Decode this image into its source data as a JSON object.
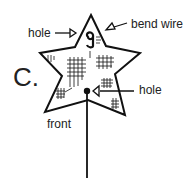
{
  "diagram": {
    "step_label": "C.",
    "labels": {
      "hole_top": "hole",
      "bend_wire": "bend wire",
      "hole_center": "hole",
      "front": "front"
    },
    "colors": {
      "stroke": "#111111",
      "background": "#ffffff"
    }
  }
}
